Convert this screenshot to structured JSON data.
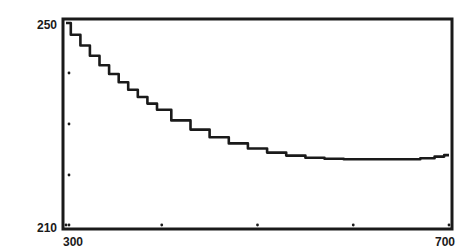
{
  "chart_data": {
    "type": "line",
    "title": "",
    "xlabel": "",
    "ylabel": "",
    "xlim": [
      300,
      700
    ],
    "ylim": [
      210,
      250
    ],
    "x_tick_labels": [
      "300",
      "700"
    ],
    "y_tick_labels": [
      "250",
      "210"
    ],
    "x_minor_ticks": [
      300,
      400,
      500,
      600,
      700
    ],
    "y_minor_ticks": [
      210,
      220,
      230,
      240
    ],
    "grid": false,
    "legend": null,
    "series": [
      {
        "name": "curve",
        "color": "#1a1a1a",
        "x": [
          300,
          310,
          320,
          330,
          340,
          350,
          360,
          370,
          380,
          390,
          400,
          420,
          440,
          460,
          480,
          500,
          520,
          540,
          560,
          580,
          600,
          620,
          640,
          660,
          680,
          690,
          700
        ],
        "y": [
          249.8,
          247.5,
          245.4,
          243.4,
          241.5,
          239.8,
          238.2,
          236.7,
          235.3,
          234.0,
          232.8,
          230.7,
          228.9,
          227.4,
          226.2,
          225.2,
          224.4,
          223.8,
          223.4,
          223.2,
          223.1,
          223.1,
          223.1,
          223.1,
          223.3,
          223.6,
          223.9
        ]
      }
    ]
  },
  "labels": {
    "y_top": "250",
    "y_bottom": "210",
    "x_left": "300",
    "x_right": "700"
  }
}
